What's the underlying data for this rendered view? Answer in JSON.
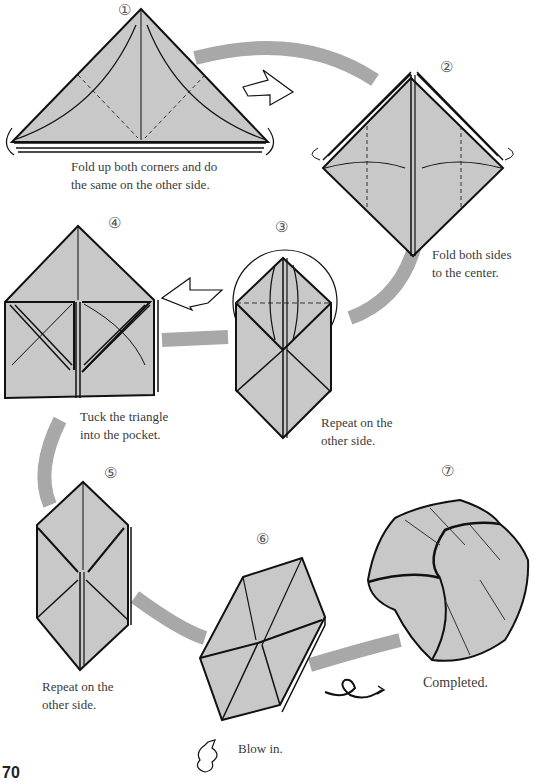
{
  "diagram": {
    "colors": {
      "paper": "#c8c8c8",
      "flow_arc": "#a8a8a8",
      "line": "#111111",
      "background": "#ffffff"
    },
    "steps": [
      {
        "number": "①",
        "caption": [
          "Fold up both corners and do",
          "the same on the other side."
        ]
      },
      {
        "number": "②",
        "caption": [
          "Fold both sides",
          "to the center."
        ]
      },
      {
        "number": "③",
        "caption": [
          "Repeat on the",
          "other side."
        ]
      },
      {
        "number": "④",
        "caption": [
          "Tuck the triangle",
          "into the pocket."
        ]
      },
      {
        "number": "⑤",
        "caption": [
          "Repeat on the",
          "other side."
        ]
      },
      {
        "number": "⑥",
        "caption": [
          "Blow in."
        ]
      },
      {
        "number": "⑦",
        "caption": [
          "Completed."
        ]
      }
    ],
    "page_number": "70"
  }
}
